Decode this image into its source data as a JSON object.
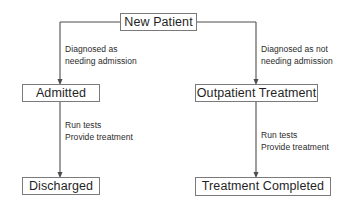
{
  "diagram": {
    "title_node": "New Patient",
    "background": "#ffffff",
    "stroke_color": "#7a7a7a",
    "text_color": "#1f1f1f",
    "nodes": [
      {
        "id": "new-patient",
        "label": "New Patient"
      },
      {
        "id": "admitted",
        "label": "Admitted"
      },
      {
        "id": "outpatient-treatment",
        "label": "Outpatient Treatment"
      },
      {
        "id": "discharged",
        "label": "Discharged"
      },
      {
        "id": "treatment-completed",
        "label": "Treatment Completed"
      }
    ],
    "edge_labels": {
      "left_branch": {
        "line1": "Diagnosed as",
        "line2": "needing admission"
      },
      "right_branch": {
        "line1": "Diagnosed as not",
        "line2": "needing admission"
      },
      "left_process": {
        "line1": "Run tests",
        "line2": "Provide treatment"
      },
      "right_process": {
        "line1": "Run tests",
        "line2": "Provide treatment"
      }
    }
  }
}
